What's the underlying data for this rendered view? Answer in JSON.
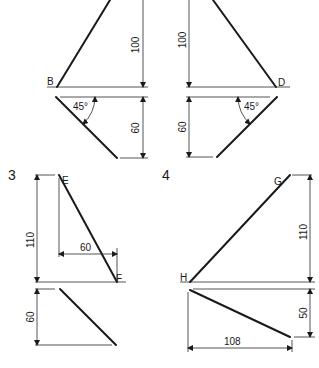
{
  "figures": [
    {
      "id": "1",
      "number_label": "",
      "points": {
        "bottom": "B"
      },
      "dimensions": {
        "height": "100",
        "depth": "60",
        "angle": "45°"
      }
    },
    {
      "id": "2",
      "number_label": "",
      "points": {
        "bottom": "D"
      },
      "dimensions": {
        "height": "100",
        "depth": "60",
        "angle": "45°"
      }
    },
    {
      "id": "3",
      "number_label": "3",
      "points": {
        "top": "E",
        "bottom": "F"
      },
      "dimensions": {
        "height": "110",
        "horizontal": "60",
        "depth": "60"
      }
    },
    {
      "id": "4",
      "number_label": "4",
      "points": {
        "top": "G",
        "bottom": "H"
      },
      "dimensions": {
        "height": "110",
        "depth": "50",
        "horizontal": "108"
      }
    }
  ]
}
